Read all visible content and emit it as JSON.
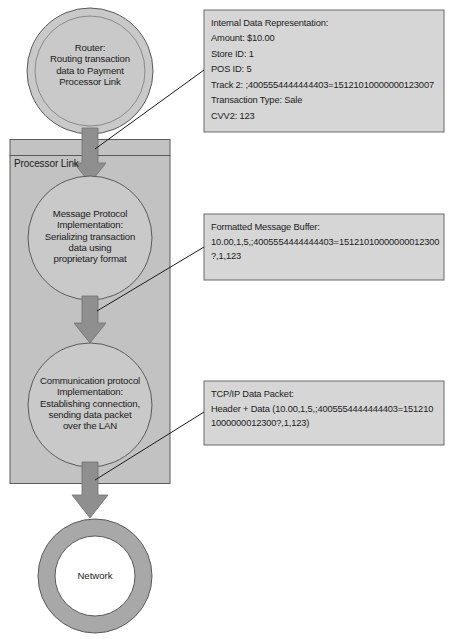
{
  "diagram": {
    "title_nodes": {
      "router": {
        "name": "router-node",
        "lines": [
          "Router:",
          "Routing transaction",
          "data to Payment",
          "Processor Link"
        ]
      },
      "message_protocol": {
        "name": "message-protocol-node",
        "lines": [
          "Message Protocol",
          "Implementation:",
          "Serializing transaction",
          "data using",
          "proprietary format"
        ]
      },
      "communication_protocol": {
        "name": "communication-protocol-node",
        "lines": [
          "Communication protocol",
          "Implementation:",
          "Establishing connection,",
          "sending data packet",
          "over the LAN"
        ]
      },
      "network": {
        "name": "network-node",
        "label": "Network"
      }
    },
    "container": {
      "label": "Processor Link"
    },
    "callouts": [
      {
        "id": "internal-data-representation",
        "lines": [
          "Internal Data Representation:",
          "Amount: $10.00",
          "Store ID: 1",
          "POS ID: 5",
          "Track 2: ;4005554444444403=15121010000000123007",
          "Transaction Type: Sale",
          "CVV2: 123"
        ]
      },
      {
        "id": "formatted-message-buffer",
        "lines": [
          "Formatted Message Buffer:",
          "10.00,1,5,;4005554444444403=15121010000000012300",
          "?,1,123"
        ]
      },
      {
        "id": "tcp-ip-data-packet",
        "lines": [
          "TCP/IP Data Packet:",
          "Header + Data (10.00,1,5,;4005554444444403=151210",
          "1000000012300?,1,123)"
        ]
      }
    ],
    "colors": {
      "shape_fill": "#c9c9c9",
      "container_fill": "#c2c2c2",
      "arrow_fill": "#8f8f8f",
      "callout_fill": "#d6d6d6",
      "stroke": "#555555",
      "text": "#1b1b1b",
      "background": "#ffffff"
    }
  }
}
